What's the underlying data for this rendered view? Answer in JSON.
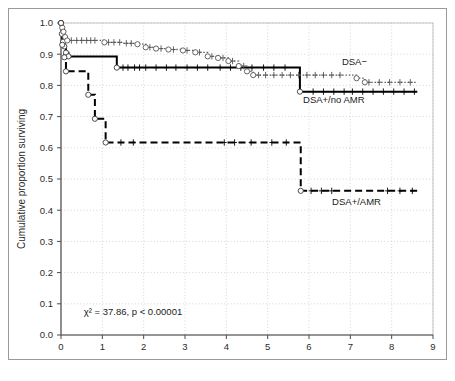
{
  "figure": {
    "background_color": "#ffffff",
    "frame_color": "#9a9a9a"
  },
  "chart_data": {
    "type": "line",
    "subtype": "kaplan-meier-step",
    "title": "",
    "xlabel": "Time",
    "ylabel": "Cumulative proportion surviving",
    "xlim": [
      0,
      9
    ],
    "ylim": [
      0.0,
      1.0
    ],
    "xticks": [
      0,
      1,
      2,
      3,
      4,
      5,
      6,
      7,
      8,
      9
    ],
    "xtick_labels": [
      "0",
      "1",
      "2",
      "3",
      "4",
      "5",
      "6",
      "7",
      "8",
      "9"
    ],
    "yticks": [
      0.0,
      0.1,
      0.2,
      0.3,
      0.4,
      0.5,
      0.6,
      0.7,
      0.8,
      0.9,
      1.0
    ],
    "ytick_labels": [
      "0.0",
      "0.1",
      "0.2",
      "0.3",
      "0.4",
      "0.5",
      "0.6",
      "0.7",
      "0.8",
      "0.9",
      "1.0"
    ],
    "grid": true,
    "grid_style": "dotted",
    "grid_color": "#cccccc",
    "legend_position": "inline-annotations",
    "annotations": [
      {
        "name": "logrank-statistic",
        "text": "χ² = 37.86, p < 0.00001",
        "x": 0.55,
        "y": 0.065
      }
    ],
    "series": [
      {
        "name": "DSA−",
        "label": "DSA−",
        "line_style": "solid",
        "color": "#000000",
        "label_x": 7.1,
        "label_y": 0.865,
        "points": [
          [
            0.0,
            1.0
          ],
          [
            0.02,
            0.965
          ],
          [
            0.05,
            0.94
          ],
          [
            0.08,
            0.925
          ],
          [
            0.12,
            0.905
          ],
          [
            0.18,
            0.893
          ],
          [
            1.32,
            0.893
          ],
          [
            1.35,
            0.857
          ],
          [
            4.55,
            0.857
          ],
          [
            5.72,
            0.857
          ],
          [
            5.78,
            0.78
          ],
          [
            8.62,
            0.78
          ]
        ],
        "censor_times": [
          1.5,
          1.62,
          1.78,
          1.9,
          2.05,
          2.3,
          2.55,
          2.78,
          3.05,
          3.3,
          3.55,
          3.85,
          4.1,
          4.35,
          4.62,
          4.9,
          5.15,
          5.42,
          6.1,
          6.35,
          6.6,
          6.85,
          7.05,
          7.3,
          7.55,
          7.8,
          8.05,
          8.3,
          8.55
        ],
        "event_markers": [
          [
            0.0,
            1.0
          ],
          [
            0.02,
            0.965
          ],
          [
            0.05,
            0.94
          ],
          [
            0.08,
            0.925
          ],
          [
            0.12,
            0.905
          ],
          [
            0.18,
            0.893
          ],
          [
            1.35,
            0.857
          ],
          [
            5.78,
            0.78
          ]
        ]
      },
      {
        "name": "DSA+/no AMR",
        "label": "DSA+/no AMR",
        "line_style": "dotted",
        "color": "#555555",
        "label_x": 6.6,
        "label_y": 0.742,
        "points": [
          [
            0.0,
            1.0
          ],
          [
            0.03,
            0.985
          ],
          [
            0.06,
            0.972
          ],
          [
            0.1,
            0.955
          ],
          [
            0.15,
            0.944
          ],
          [
            0.9,
            0.944
          ],
          [
            1.05,
            0.938
          ],
          [
            1.5,
            0.935
          ],
          [
            1.85,
            0.932
          ],
          [
            2.05,
            0.922
          ],
          [
            2.3,
            0.918
          ],
          [
            2.6,
            0.915
          ],
          [
            2.95,
            0.912
          ],
          [
            3.25,
            0.906
          ],
          [
            3.55,
            0.893
          ],
          [
            3.8,
            0.888
          ],
          [
            4.05,
            0.878
          ],
          [
            4.3,
            0.862
          ],
          [
            4.5,
            0.845
          ],
          [
            4.65,
            0.833
          ],
          [
            6.9,
            0.833
          ],
          [
            7.15,
            0.823
          ],
          [
            7.35,
            0.81
          ],
          [
            8.62,
            0.81
          ]
        ],
        "censor_times": [
          0.25,
          0.38,
          0.5,
          0.62,
          0.72,
          0.82,
          1.15,
          1.28,
          1.42,
          1.58,
          1.7,
          2.15,
          2.42,
          2.72,
          3.05,
          3.35,
          3.65,
          3.92,
          4.15,
          4.42,
          4.78,
          4.95,
          5.15,
          5.35,
          5.55,
          5.75,
          5.95,
          6.15,
          6.35,
          6.55,
          6.75,
          7.45,
          7.7,
          7.95,
          8.2,
          8.45
        ],
        "event_markers": [
          [
            0.0,
            1.0
          ],
          [
            0.03,
            0.985
          ],
          [
            0.06,
            0.972
          ],
          [
            0.1,
            0.955
          ],
          [
            0.15,
            0.944
          ],
          [
            1.05,
            0.938
          ],
          [
            1.85,
            0.932
          ],
          [
            2.05,
            0.922
          ],
          [
            2.3,
            0.918
          ],
          [
            2.6,
            0.915
          ],
          [
            2.95,
            0.912
          ],
          [
            3.25,
            0.906
          ],
          [
            3.55,
            0.893
          ],
          [
            3.8,
            0.888
          ],
          [
            4.05,
            0.878
          ],
          [
            4.3,
            0.862
          ],
          [
            4.5,
            0.845
          ],
          [
            4.65,
            0.833
          ],
          [
            7.15,
            0.823
          ],
          [
            7.35,
            0.81
          ]
        ]
      },
      {
        "name": "DSA+/AMR",
        "label": "DSA+/AMR",
        "line_style": "dashed",
        "color": "#000000",
        "label_x": 7.15,
        "label_y": 0.418,
        "points": [
          [
            0.0,
            1.0
          ],
          [
            0.03,
            0.93
          ],
          [
            0.08,
            0.89
          ],
          [
            0.12,
            0.845
          ],
          [
            0.62,
            0.845
          ],
          [
            0.66,
            0.77
          ],
          [
            0.78,
            0.77
          ],
          [
            0.82,
            0.693
          ],
          [
            1.02,
            0.693
          ],
          [
            1.08,
            0.617
          ],
          [
            5.72,
            0.617
          ],
          [
            5.8,
            0.462
          ],
          [
            8.62,
            0.462
          ]
        ],
        "censor_times": [
          1.45,
          1.75,
          3.95,
          4.2,
          4.6,
          5.1,
          5.45,
          6.05,
          6.3,
          6.55,
          7.9,
          8.2,
          8.5
        ],
        "event_markers": [
          [
            0.0,
            1.0
          ],
          [
            0.03,
            0.93
          ],
          [
            0.08,
            0.89
          ],
          [
            0.12,
            0.845
          ],
          [
            0.66,
            0.77
          ],
          [
            0.82,
            0.693
          ],
          [
            1.08,
            0.617
          ],
          [
            5.8,
            0.462
          ]
        ]
      }
    ]
  }
}
